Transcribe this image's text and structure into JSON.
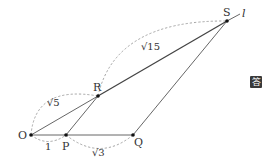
{
  "diagram": {
    "points": {
      "O": {
        "label": "O"
      },
      "P": {
        "label": "P"
      },
      "Q": {
        "label": "Q"
      },
      "R": {
        "label": "R"
      },
      "S": {
        "label": "S"
      }
    },
    "line_label": "l",
    "measures": {
      "OP": "1",
      "PQ": "√3",
      "OR": "√5",
      "RS": "√15"
    },
    "answer_badge": "答"
  }
}
